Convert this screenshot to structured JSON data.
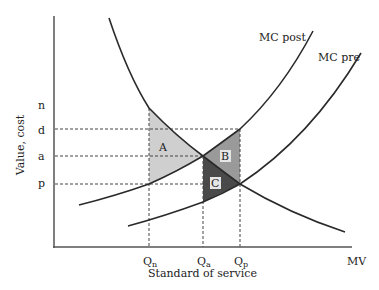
{
  "diagram": {
    "type": "economics-cost-value-curves",
    "axes": {
      "y_label": "Value, cost",
      "x_label": "Standard of service",
      "x_end_label": "MV"
    },
    "y_ticks": [
      {
        "id": "n",
        "label": "n"
      },
      {
        "id": "d",
        "label": "d"
      },
      {
        "id": "a",
        "label": "a"
      },
      {
        "id": "p",
        "label": "p"
      }
    ],
    "x_ticks": [
      {
        "id": "Qn",
        "main": "Q",
        "sub": "n"
      },
      {
        "id": "Qa",
        "main": "Q",
        "sub": "a"
      },
      {
        "id": "Qp",
        "main": "Q",
        "sub": "p"
      }
    ],
    "curves": [
      {
        "id": "mv",
        "label": "MV",
        "description": "Marginal value (downward sloping)"
      },
      {
        "id": "mc_post",
        "label": "MC post"
      },
      {
        "id": "mc_pre",
        "label": "MC pre"
      }
    ],
    "regions": [
      {
        "id": "A",
        "label": "A",
        "fill": "#cfcfcf"
      },
      {
        "id": "B",
        "label": "B",
        "fill": "#9a9a9a"
      },
      {
        "id": "C",
        "label": "C",
        "fill": "#4a4a4a"
      }
    ],
    "colors": {
      "line": "#2a2a2a",
      "axis": "#555555",
      "dash": "#444444"
    }
  }
}
